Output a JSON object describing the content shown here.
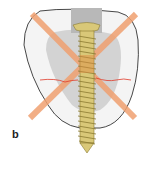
{
  "figure": {
    "panel_label": "b",
    "colors": {
      "bone_outline": "#333333",
      "bone_fill": "#f3f3f3",
      "inner_region": "#cfcfcf",
      "canal": "#b9b9b9",
      "cross": "#f0a070",
      "fracture_line": "#e03a2a",
      "screw": "#d9c878",
      "screw_dark": "#9a8a3a"
    }
  }
}
